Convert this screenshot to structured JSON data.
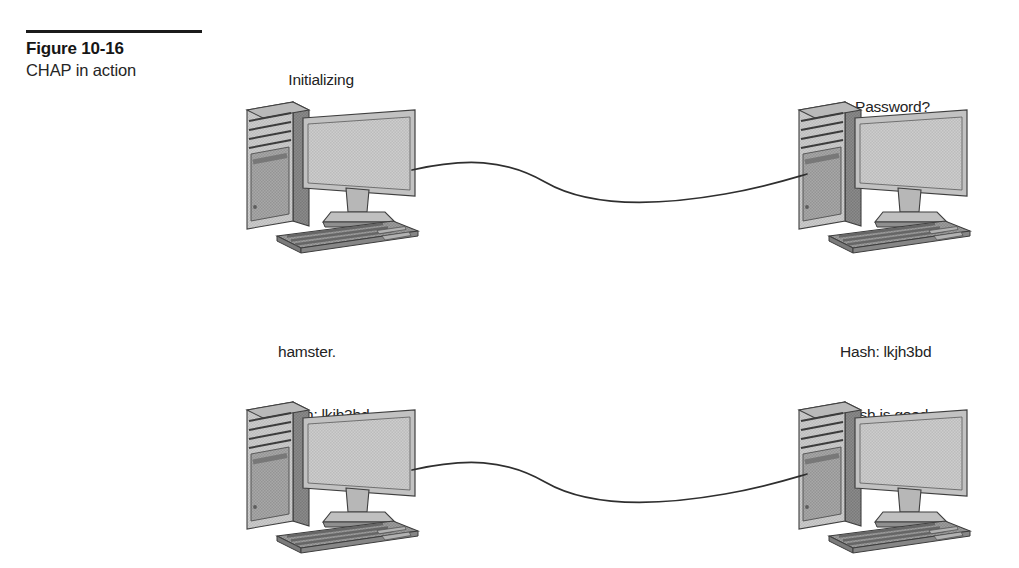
{
  "figure": {
    "number": "Figure 10-16",
    "title": "CHAP in action"
  },
  "annotations": {
    "top_left": {
      "line1": "Initializing",
      "line2": "connection…"
    },
    "top_right": {
      "line1": "Password?"
    },
    "bottom_left": {
      "line1": "hamster.",
      "line2": "Hash: lkjh3bd",
      "line3": "Sending hash…"
    },
    "bottom_right": {
      "line1": "Hash: lkjh3bd",
      "line2": "Hash is good.",
      "line3": "Access granted."
    }
  },
  "devices": {
    "top_left": "desktop-computer",
    "top_right": "desktop-computer",
    "bottom_left": "desktop-computer",
    "bottom_right": "desktop-computer"
  },
  "links": {
    "top": "network-cable",
    "bottom": "network-cable"
  },
  "colors": {
    "background": "#ffffff",
    "ink": "#1b1b1b",
    "screen_fill": "#c9c9c9",
    "case_front": "#b4b4b4",
    "case_side": "#848484",
    "bezel": "#bdbdbd",
    "keyboard": "#9a9a9a",
    "outline": "#4a4a4a",
    "cable": "#333333"
  }
}
